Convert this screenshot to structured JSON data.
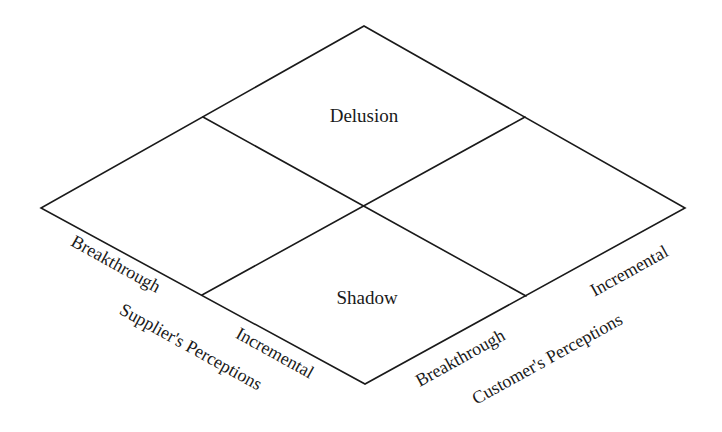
{
  "diagram": {
    "type": "rotated 2x2 matrix",
    "quadrants": {
      "top": "Delusion",
      "bottom": "Shadow",
      "left": "",
      "right": ""
    },
    "supplier_axis": {
      "title": "Supplier's Perceptions",
      "low": "Breakthrough",
      "high": "Incremental"
    },
    "customer_axis": {
      "title": "Customer's Perceptions",
      "low": "Breakthrough",
      "high": "Incremental"
    }
  },
  "colors": {
    "line": "#1a1a1a",
    "text": "#1a1a1a",
    "background": "#ffffff"
  }
}
